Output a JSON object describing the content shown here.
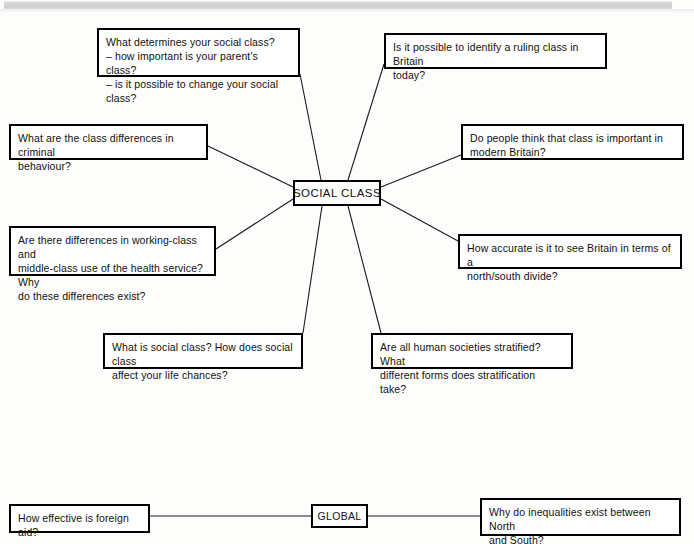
{
  "page": {
    "background_color": "#fdfdfc",
    "line_color": "#1a1a1a",
    "box_border_color": "#000000",
    "scan_bar_color": "#cdcdcd"
  },
  "diagram": {
    "type": "mind-map",
    "center": {
      "id": "social-class",
      "label": "SOCIAL CLASS",
      "x": 293,
      "y": 180,
      "width": 88,
      "height": 26
    },
    "branches": [
      {
        "id": "determines",
        "label": "What determines your social class?\n– how important is your parent's class?\n– is it possible to change your social class?",
        "x": 97,
        "y": 28,
        "width": 203,
        "height": 49,
        "anchor": {
          "x": 300,
          "y": 74
        }
      },
      {
        "id": "ruling-class",
        "label": "Is it possible to identify a ruling class in Britain\ntoday?",
        "x": 384,
        "y": 33,
        "width": 223,
        "height": 36,
        "anchor": {
          "x": 384,
          "y": 64
        }
      },
      {
        "id": "criminal-behaviour",
        "label": "What are the class differences in criminal\nbehaviour?",
        "x": 9,
        "y": 124,
        "width": 199,
        "height": 36,
        "anchor": {
          "x": 208,
          "y": 146
        }
      },
      {
        "id": "class-important",
        "label": "Do people think that class is important in\nmodern Britain?",
        "x": 461,
        "y": 124,
        "width": 223,
        "height": 36,
        "anchor": {
          "x": 461,
          "y": 155
        }
      },
      {
        "id": "health-service",
        "label": "Are there differences in working-class and\nmiddle-class use of the health service? Why\ndo these differences exist?",
        "x": 9,
        "y": 226,
        "width": 207,
        "height": 50,
        "anchor": {
          "x": 216,
          "y": 249
        }
      },
      {
        "id": "north-south-divide",
        "label": "How accurate is it to see Britain in terms of a\nnorth/south divide?",
        "x": 458,
        "y": 234,
        "width": 224,
        "height": 35,
        "anchor": {
          "x": 458,
          "y": 241
        }
      },
      {
        "id": "life-chances",
        "label": "What is social class? How does social class\naffect your life chances?",
        "x": 103,
        "y": 333,
        "width": 200,
        "height": 36,
        "anchor": {
          "x": 303,
          "y": 333
        }
      },
      {
        "id": "stratification",
        "label": "Are all human societies stratified? What\ndifferent forms does stratification take?",
        "x": 371,
        "y": 333,
        "width": 202,
        "height": 36,
        "anchor": {
          "x": 381,
          "y": 333
        }
      }
    ],
    "global_group": {
      "center": {
        "id": "global",
        "label": "GLOBAL",
        "x": 311,
        "y": 504,
        "width": 57,
        "height": 24
      },
      "branches": [
        {
          "id": "foreign-aid",
          "label": "How effective is foreign aid?",
          "x": 9,
          "y": 504,
          "width": 141,
          "height": 29,
          "anchor": {
            "x": 150,
            "y": 516
          }
        },
        {
          "id": "north-south-inequalities",
          "label": "Why do inequalities exist between North\nand South?",
          "x": 480,
          "y": 498,
          "width": 201,
          "height": 38,
          "anchor": {
            "x": 480,
            "y": 516
          }
        }
      ]
    },
    "connectors": [
      {
        "from": "social-class",
        "to": "determines",
        "x1": 321,
        "y1": 180,
        "x2": 300,
        "y2": 74
      },
      {
        "from": "social-class",
        "to": "ruling-class",
        "x1": 348,
        "y1": 180,
        "x2": 384,
        "y2": 64
      },
      {
        "from": "social-class",
        "to": "criminal-behaviour",
        "x1": 293,
        "y1": 187,
        "x2": 208,
        "y2": 146
      },
      {
        "from": "social-class",
        "to": "class-important",
        "x1": 381,
        "y1": 187,
        "x2": 461,
        "y2": 155
      },
      {
        "from": "social-class",
        "to": "health-service",
        "x1": 293,
        "y1": 199,
        "x2": 216,
        "y2": 249
      },
      {
        "from": "social-class",
        "to": "north-south-divide",
        "x1": 381,
        "y1": 199,
        "x2": 458,
        "y2": 241
      },
      {
        "from": "social-class",
        "to": "life-chances",
        "x1": 322,
        "y1": 206,
        "x2": 303,
        "y2": 333
      },
      {
        "from": "social-class",
        "to": "stratification",
        "x1": 348,
        "y1": 206,
        "x2": 381,
        "y2": 333
      },
      {
        "from": "global",
        "to": "foreign-aid",
        "x1": 311,
        "y1": 516,
        "x2": 150,
        "y2": 516
      },
      {
        "from": "global",
        "to": "north-south-inequalities",
        "x1": 368,
        "y1": 516,
        "x2": 480,
        "y2": 516
      }
    ]
  }
}
